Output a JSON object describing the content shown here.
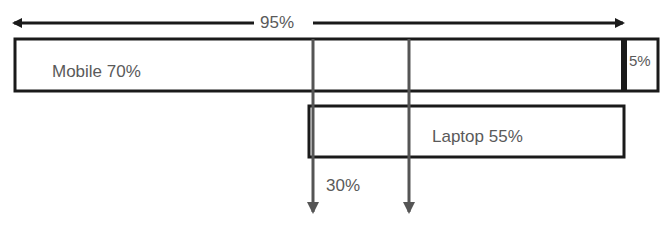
{
  "diagram": {
    "type": "overlap-bar",
    "top_span": {
      "label": "95%"
    },
    "mobile": {
      "label": "Mobile 70%",
      "value": 70
    },
    "mobile_only_extra": {
      "label": "5%",
      "value": 5
    },
    "laptop": {
      "label": "Laptop 55%",
      "value": 55
    },
    "overlap": {
      "label": "30%",
      "value": 30
    },
    "colors": {
      "line": "#1a1a1a",
      "text": "#5a5a5a",
      "arrow": "#555555"
    }
  }
}
